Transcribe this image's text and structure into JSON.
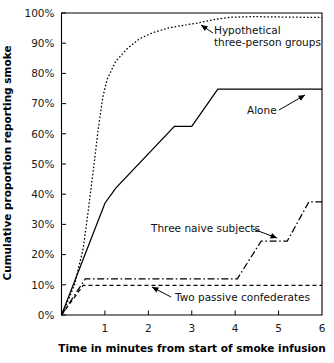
{
  "chart_data": {
    "type": "line",
    "title": "",
    "xlabel": "Time in minutes from start of smoke infusion",
    "ylabel": "Cumulative proportion reporting smoke",
    "xlim": [
      0,
      6
    ],
    "ylim": [
      0,
      100
    ],
    "grid": false,
    "legend_position": "inline-annotations",
    "x_ticks": [
      0,
      1,
      2,
      3,
      4,
      5,
      6
    ],
    "x_tick_labels": [
      "",
      "1",
      "2",
      "3",
      "4",
      "5",
      "6"
    ],
    "y_ticks": [
      0,
      10,
      20,
      30,
      40,
      50,
      60,
      70,
      80,
      90,
      100
    ],
    "y_tick_labels": [
      "0%",
      "10%",
      "20%",
      "30%",
      "40%",
      "50%",
      "60%",
      "70%",
      "80%",
      "90%",
      "100%"
    ],
    "series": [
      {
        "name": "Hypothetical three-person groups",
        "style": "dotted",
        "points": [
          [
            0.0,
            0.0
          ],
          [
            0.1,
            3.0
          ],
          [
            0.3,
            10.0
          ],
          [
            0.5,
            22.0
          ],
          [
            0.62,
            35.0
          ],
          [
            0.75,
            50.0
          ],
          [
            0.85,
            62.0
          ],
          [
            0.95,
            72.0
          ],
          [
            1.05,
            78.0
          ],
          [
            1.25,
            84.0
          ],
          [
            1.5,
            88.0
          ],
          [
            1.8,
            91.5
          ],
          [
            2.1,
            93.5
          ],
          [
            2.45,
            95.0
          ],
          [
            2.75,
            95.8
          ],
          [
            3.1,
            96.6
          ],
          [
            3.5,
            97.8
          ],
          [
            3.9,
            98.6
          ],
          [
            4.4,
            98.8
          ],
          [
            6.0,
            98.5
          ]
        ]
      },
      {
        "name": "Alone",
        "style": "solid",
        "points": [
          [
            0.0,
            0.0
          ],
          [
            1.0,
            37.0
          ],
          [
            1.25,
            42.0
          ],
          [
            2.6,
            62.5
          ],
          [
            3.0,
            62.5
          ],
          [
            3.6,
            74.8
          ],
          [
            6.0,
            74.8
          ]
        ]
      },
      {
        "name": "Three naive subjects",
        "style": "dashdot",
        "points": [
          [
            0.0,
            0.0
          ],
          [
            0.55,
            12.0
          ],
          [
            4.05,
            12.0
          ],
          [
            4.6,
            24.5
          ],
          [
            5.2,
            24.5
          ],
          [
            5.7,
            37.5
          ],
          [
            6.0,
            37.5
          ]
        ]
      },
      {
        "name": "Two passive confederates",
        "style": "dashed",
        "points": [
          [
            0.0,
            0.0
          ],
          [
            0.5,
            9.8
          ],
          [
            6.0,
            9.8
          ]
        ]
      }
    ],
    "annotations": [
      {
        "id": "hypothetical-label",
        "text_lines": [
          "Hypothetical",
          "three-person groups"
        ],
        "text_x": 214,
        "text_y": 34,
        "arrow_from": [
          213,
          33
        ],
        "arrow_to": [
          201,
          25
        ]
      },
      {
        "id": "alone-label",
        "text_lines": [
          "Alone"
        ],
        "text_x": 247,
        "text_y": 114,
        "arrow_from": [
          279,
          110
        ],
        "arrow_to": [
          305,
          95
        ]
      },
      {
        "id": "three-naive-label",
        "text_lines": [
          "Three naive subjects"
        ],
        "text_x": 151,
        "text_y": 232,
        "arrow_from": [
          253,
          229
        ],
        "arrow_to": [
          277,
          238
        ]
      },
      {
        "id": "two-passive-label",
        "text_lines": [
          "Two passive confederates"
        ],
        "text_x": 175,
        "text_y": 301,
        "arrow_from": [
          171,
          297
        ],
        "arrow_to": [
          152,
          287
        ]
      }
    ]
  },
  "colors": {
    "ink": "#000000",
    "tick_text": "#1a1a1a",
    "background": "#ffffff"
  }
}
